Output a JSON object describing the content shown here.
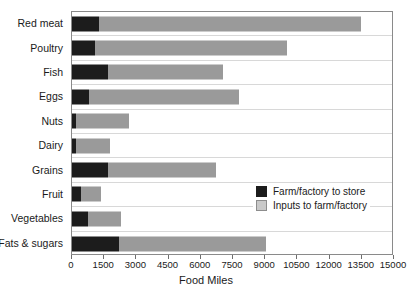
{
  "chart_data": {
    "type": "bar",
    "orientation": "horizontal",
    "stacked": true,
    "title": "",
    "xlabel": "Food Miles",
    "ylabel": "",
    "xlim": [
      0,
      15000
    ],
    "xticks": [
      0,
      1500,
      3000,
      4500,
      6000,
      7500,
      9000,
      10500,
      12000,
      13500,
      15000
    ],
    "xtick_labels": [
      "0",
      "1500",
      "3000",
      "4500",
      "6000",
      "7500",
      "9000",
      "10500",
      "12000",
      "13500",
      "15000"
    ],
    "grid": "horizontal-row-separators",
    "legend_position": "inside-right-lower",
    "categories": [
      "Red meat",
      "Poultry",
      "Fish",
      "Eggs",
      "Nuts",
      "Dairy",
      "Grains",
      "Fruit",
      "Vegetables",
      "Fats & sugars"
    ],
    "series": [
      {
        "name": "Farm/factory to store",
        "color": "#1c1c1c",
        "values": [
          1250,
          1050,
          1700,
          800,
          200,
          200,
          1700,
          420,
          750,
          2200
        ]
      },
      {
        "name": "Inputs to farm/factory",
        "color": "#9a9a9a",
        "values": [
          12200,
          8950,
          5350,
          7000,
          2450,
          1550,
          5000,
          930,
          1550,
          6850
        ]
      }
    ],
    "totals": [
      13450,
      10000,
      7050,
      7800,
      2650,
      1750,
      6700,
      1350,
      2300,
      9050
    ]
  },
  "legend": {
    "items": [
      {
        "label": "Farm/factory to store",
        "swatch": "dark"
      },
      {
        "label": "Inputs to farm/factory",
        "swatch": "light"
      }
    ]
  },
  "axis": {
    "x_title": "Food Miles"
  }
}
